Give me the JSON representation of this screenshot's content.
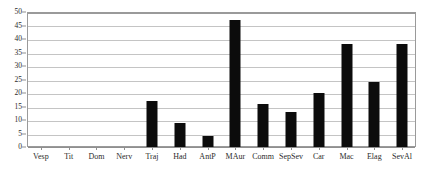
{
  "chart_data": {
    "type": "bar",
    "title": "",
    "subtitle": "",
    "xlabel": "",
    "ylabel": "",
    "categories": [
      "Vesp",
      "Tit",
      "Dom",
      "Nerv",
      "Traj",
      "Had",
      "AntP",
      "MAur",
      "Comm",
      "SepSev",
      "Car",
      "Mac",
      "Elag",
      "SevAl"
    ],
    "values": [
      0,
      0,
      0,
      0,
      17,
      9,
      4,
      47,
      16,
      13,
      20,
      38,
      24,
      38
    ],
    "ylim": [
      0,
      50
    ],
    "y_ticks": [
      0,
      5,
      10,
      15,
      20,
      25,
      30,
      35,
      40,
      45,
      50
    ],
    "y_tick_labels": [
      "0",
      "5",
      "10",
      "15",
      "20",
      "25",
      "30",
      "35",
      "40",
      "45",
      "50"
    ],
    "grid": true,
    "legend": null,
    "legend_position": "none",
    "bar_color": "#0c0c0c",
    "gridline_color": "#c4c4c4",
    "frame_color": "#9a9a9a",
    "background_color": "#ffffff"
  }
}
